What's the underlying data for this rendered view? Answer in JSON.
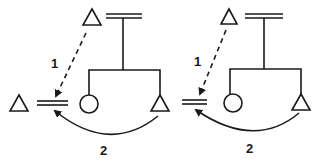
{
  "colors": {
    "stroke": "#1a1a1a",
    "background": "#ffffff"
  },
  "panels": [
    {
      "id": "left",
      "step1_label": "1",
      "step2_label": "2",
      "nodes": {
        "far_triangle": {
          "shape": "triangle",
          "cx": 19,
          "top": 95,
          "base": 111,
          "half": 9
        },
        "target_double_line": {
          "shape": "double-line",
          "x1": 37,
          "x2": 68,
          "y": 103
        },
        "source_triangle": {
          "shape": "triangle",
          "cx": 92,
          "top": 9,
          "base": 25,
          "half": 9
        },
        "top_double_line": {
          "shape": "double-line",
          "x1": 106,
          "x2": 142,
          "y": 16
        },
        "circle": {
          "shape": "circle",
          "cx": 89,
          "cy": 104,
          "r": 9
        },
        "child_triangle": {
          "shape": "triangle",
          "cx": 160,
          "top": 95,
          "base": 111,
          "half": 9
        }
      }
    },
    {
      "id": "right",
      "step1_label": "1",
      "step2_label": "2",
      "nodes": {
        "target_double_line": {
          "shape": "double-line",
          "x1": 182,
          "x2": 207,
          "y": 102
        },
        "source_triangle": {
          "shape": "triangle",
          "cx": 229,
          "top": 9,
          "base": 24,
          "half": 8
        },
        "top_double_line": {
          "shape": "double-line",
          "x1": 245,
          "x2": 283,
          "y": 16
        },
        "circle": {
          "shape": "circle",
          "cx": 233,
          "cy": 103,
          "r": 9
        },
        "child_triangle": {
          "shape": "triangle",
          "cx": 301,
          "top": 94,
          "base": 110,
          "half": 9
        }
      }
    }
  ]
}
